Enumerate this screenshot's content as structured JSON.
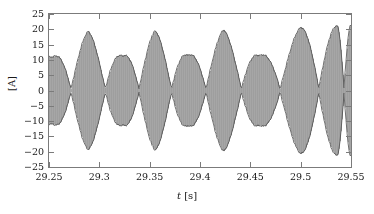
{
  "chart_data": {
    "type": "line",
    "title": "",
    "subtitle": "",
    "xlabel": "t [s]",
    "xlabel_symbol": "t",
    "xlabel_unit": "[s]",
    "ylabel": "[A]",
    "xlim": [
      29.25,
      29.55
    ],
    "ylim": [
      -25,
      25
    ],
    "xticks": [
      29.25,
      29.3,
      29.35,
      29.4,
      29.45,
      29.5,
      29.55
    ],
    "xtick_labels": [
      "29.25",
      "29.3",
      "29.35",
      "29.4",
      "29.45",
      "29.5",
      "29.55"
    ],
    "yticks": [
      -25,
      -20,
      -15,
      -10,
      -5,
      0,
      5,
      10,
      15,
      20,
      25
    ],
    "ytick_labels": [
      "-25",
      "-20",
      "-15",
      "-10",
      "-5",
      "0",
      "5",
      "10",
      "15",
      "20",
      "25"
    ],
    "grid": false,
    "legend": null,
    "legend_position": "none",
    "series": [
      {
        "name": "current",
        "color": "#a6a6a6",
        "edge_color": "#4a4a4a",
        "description": "High-frequency current waveform with amplitude beating; envelope alternates between small and large lobes.",
        "carrier_frequency_hz": 1050,
        "envelope": {
          "description": "Peak amplitude of the envelope at each anti-node, in amperes",
          "nodes_t": [
            29.2665,
            29.3115,
            29.3135,
            29.3565,
            29.379,
            29.4045,
            29.4245,
            29.47,
            29.4905,
            29.5195,
            29.524
          ],
          "antinodes": [
            {
              "t": 29.2545,
              "amplitude": 11.0
            },
            {
              "t": 29.289,
              "amplitude": 19.3
            },
            {
              "t": 29.323,
              "amplitude": 11.2
            },
            {
              "t": 29.3555,
              "amplitude": 19.5
            },
            {
              "t": 29.388,
              "amplitude": 11.4
            },
            {
              "t": 29.4235,
              "amplitude": 19.8
            },
            {
              "t": 29.459,
              "amplitude": 11.3
            },
            {
              "t": 29.5,
              "amplitude": 20.6
            },
            {
              "t": 29.536,
              "amplitude": 21.2
            },
            {
              "t": 29.55,
              "amplitude": 21.5
            }
          ],
          "beat_period_s": 0.0672,
          "min_peak_a": 11.0,
          "max_peak_a": 21.5
        }
      }
    ]
  },
  "figure": {
    "background_color": "#ffffff",
    "frame_color": "#7b7b7b",
    "text_color": "#1a1a1a",
    "fill_color": "#a6a6a6"
  }
}
